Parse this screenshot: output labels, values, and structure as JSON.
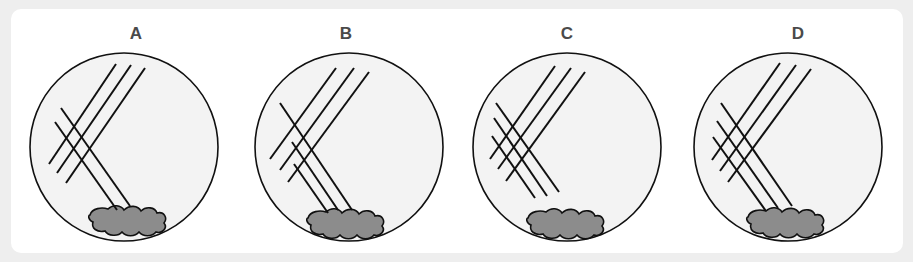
{
  "figure": {
    "panels": [
      {
        "id": "A",
        "label": "A",
        "primary_lines": 3,
        "secondary_lines": 2,
        "secondary_from_inoculum": true
      },
      {
        "id": "B",
        "label": "B",
        "primary_lines": 3,
        "secondary_lines": 3,
        "secondary_from_inoculum": true
      },
      {
        "id": "C",
        "label": "C",
        "primary_lines": 3,
        "secondary_lines": 3,
        "secondary_from_inoculum": false
      },
      {
        "id": "D",
        "label": "D",
        "primary_lines": 3,
        "secondary_lines": 3,
        "secondary_from_inoculum": true
      }
    ],
    "colors": {
      "background": "#eeeeee",
      "card": "#ffffff",
      "dish_fill": "#f3f3f3",
      "inoculum_fill": "#8c8c8c",
      "stroke": "#111111",
      "label": "#4a4a4a"
    }
  }
}
